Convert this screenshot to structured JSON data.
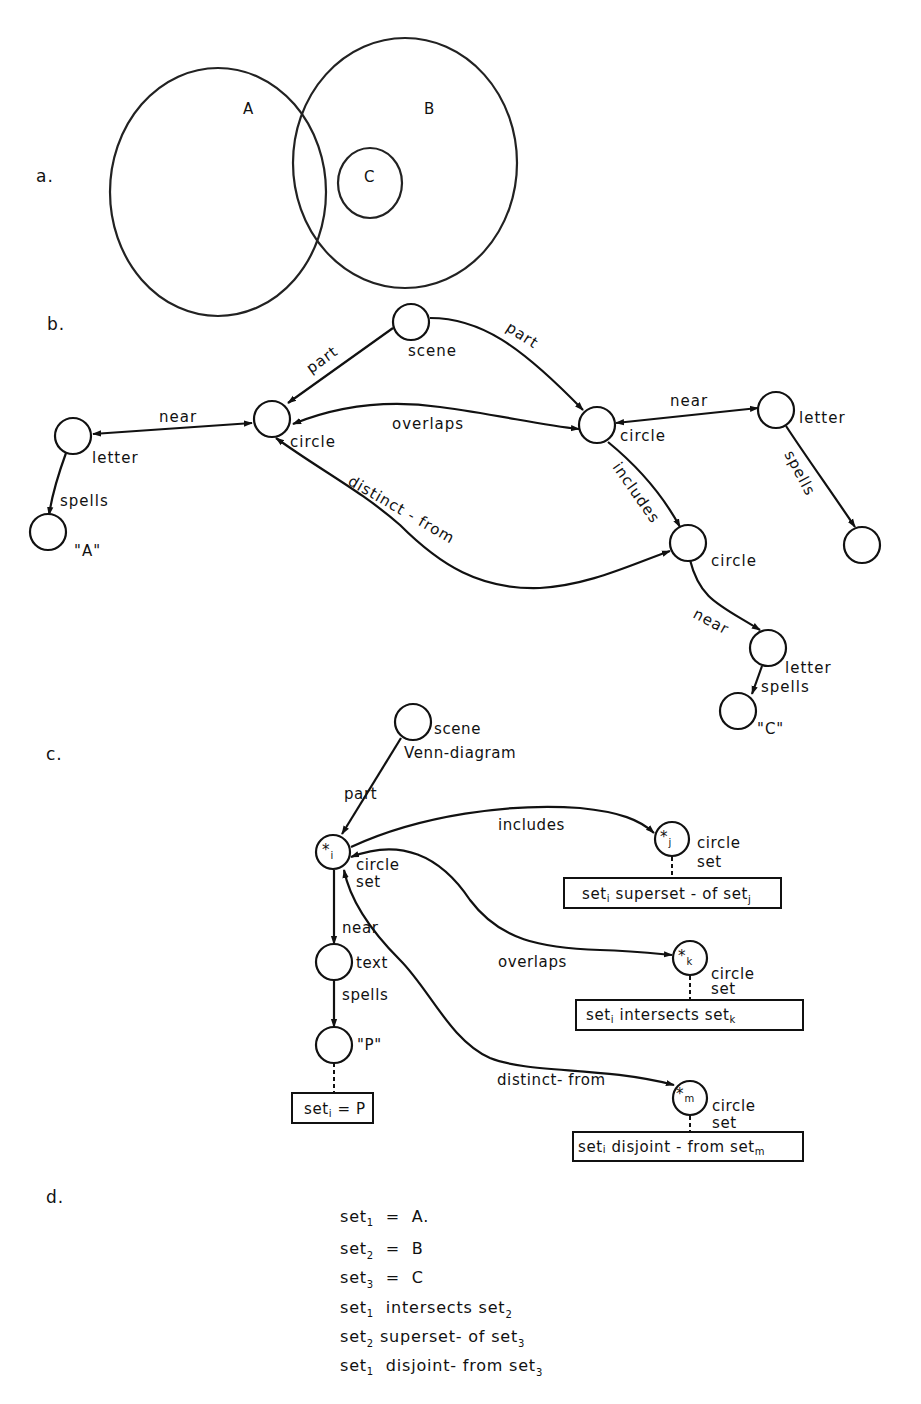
{
  "figure": {
    "sections": {
      "a": "a.",
      "b": "b.",
      "c": "c.",
      "d": "d."
    },
    "venn": {
      "circles": [
        {
          "label": "A",
          "cx": 218,
          "cy": 192,
          "rx": 108,
          "ry": 124
        },
        {
          "label": "B",
          "cx": 405,
          "cy": 163,
          "rx": 112,
          "ry": 125
        },
        {
          "label": "C",
          "cx": 370,
          "cy": 183,
          "rx": 32,
          "ry": 35
        }
      ]
    },
    "graph_b": {
      "nodes": {
        "scene": "scene",
        "circle1": "circle",
        "circle2": "circle",
        "circle3": "circle",
        "letter_a": "letter",
        "letter_b": "letter",
        "letter_c": "letter",
        "value_a": "\"A\"",
        "value_c": "\"C\""
      },
      "edges": {
        "part_left": "part",
        "part_right": "part",
        "near_a": "near",
        "near_b": "near",
        "near_c": "near",
        "overlaps": "overlaps",
        "includes": "includes",
        "distinct_from": "distinct - from",
        "spells_a": "spells",
        "spells_b": "spells",
        "spells_c": "spells"
      }
    },
    "graph_c": {
      "nodes": {
        "scene_line1": "scene",
        "scene_line2": "Venn-diagram",
        "i_symbol": "*",
        "i_sub": "i",
        "i_type1": "circle",
        "i_type2": "set",
        "j_symbol": "*",
        "j_sub": "j",
        "j_type1": "circle",
        "j_type2": "set",
        "k_symbol": "*",
        "k_sub": "k",
        "k_type1": "circle",
        "k_type2": "set",
        "m_symbol": "*",
        "m_sub": "m",
        "m_type1": "circle",
        "m_type2": "set",
        "text_node": "text",
        "p_value": "\"P\""
      },
      "edges": {
        "part": "part",
        "includes": "includes",
        "overlaps": "overlaps",
        "distinct_from": "distinct- from",
        "near": "near",
        "spells": "spells"
      },
      "boxes": {
        "superset": {
          "pre": "set",
          "pre_sub": "i",
          "mid": " superset - of set",
          "post_sub": "j"
        },
        "intersects": {
          "pre": "set",
          "pre_sub": "i",
          "mid": " intersects set",
          "post_sub": "k"
        },
        "disjoint": {
          "pre": "set",
          "pre_sub": "i",
          "mid": " disjoint - from set",
          "post_sub": "m"
        },
        "equals": {
          "pre": "set",
          "pre_sub": "i",
          "mid": " = P"
        }
      }
    },
    "section_d": {
      "lines": [
        {
          "a": "set",
          "a_sub": "1",
          "rest": "  =  A."
        },
        {
          "a": "set",
          "a_sub": "2",
          "rest": "  =  B"
        },
        {
          "a": "set",
          "a_sub": "3",
          "rest": "  =  C"
        },
        {
          "a": "set",
          "a_sub": "1",
          "rest": "  intersects set",
          "b_sub": "2"
        },
        {
          "a": "set",
          "a_sub": "2",
          "rest": " superset- of set",
          "b_sub": "3"
        },
        {
          "a": "set",
          "a_sub": "1",
          "rest": "  disjoint- from set",
          "b_sub": "3"
        }
      ]
    }
  }
}
